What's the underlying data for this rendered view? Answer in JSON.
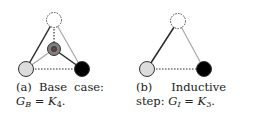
{
  "figures": [
    {
      "id": "a",
      "caption": {
        "label": "(a)",
        "line1_words": [
          "Base",
          "case:"
        ],
        "line2_graph": "G",
        "line2_graph_sub": "B",
        "line2_eq": " = ",
        "line2_rhs": "K",
        "line2_rhs_sub": "4",
        "line2_end": "."
      },
      "nodes": [
        {
          "name": "top",
          "fill": "#ffffff",
          "stroke": "dashed"
        },
        {
          "name": "center",
          "fill": "#808080",
          "stroke": "solid",
          "inner": "#404040"
        },
        {
          "name": "left",
          "fill": "#dcdcdc",
          "stroke": "solid"
        },
        {
          "name": "right",
          "fill": "#000000",
          "stroke": "solid"
        }
      ],
      "edges": [
        {
          "from": "top",
          "to": "left",
          "style": "solid-dark"
        },
        {
          "from": "top",
          "to": "right",
          "style": "solid-light"
        },
        {
          "from": "top",
          "to": "center",
          "style": "dotted"
        },
        {
          "from": "center",
          "to": "left",
          "style": "solid-light"
        },
        {
          "from": "center",
          "to": "right",
          "style": "solid-dark"
        },
        {
          "from": "left",
          "to": "right",
          "style": "dotted"
        }
      ]
    },
    {
      "id": "b",
      "caption": {
        "label": "(b)",
        "line1_words": [
          "Inductive"
        ],
        "line2_prefix": "step: ",
        "line2_graph": "G",
        "line2_graph_sub": "I",
        "line2_eq": " = ",
        "line2_rhs": "K",
        "line2_rhs_sub": "3",
        "line2_end": "."
      },
      "nodes": [
        {
          "name": "top",
          "fill": "#ffffff",
          "stroke": "dashed"
        },
        {
          "name": "left",
          "fill": "#dcdcdc",
          "stroke": "solid"
        },
        {
          "name": "right",
          "fill": "#000000",
          "stroke": "solid"
        }
      ],
      "edges": [
        {
          "from": "top",
          "to": "left",
          "style": "solid-dark"
        },
        {
          "from": "top",
          "to": "right",
          "style": "solid-light"
        },
        {
          "from": "left",
          "to": "right",
          "style": "dotted"
        }
      ]
    }
  ]
}
